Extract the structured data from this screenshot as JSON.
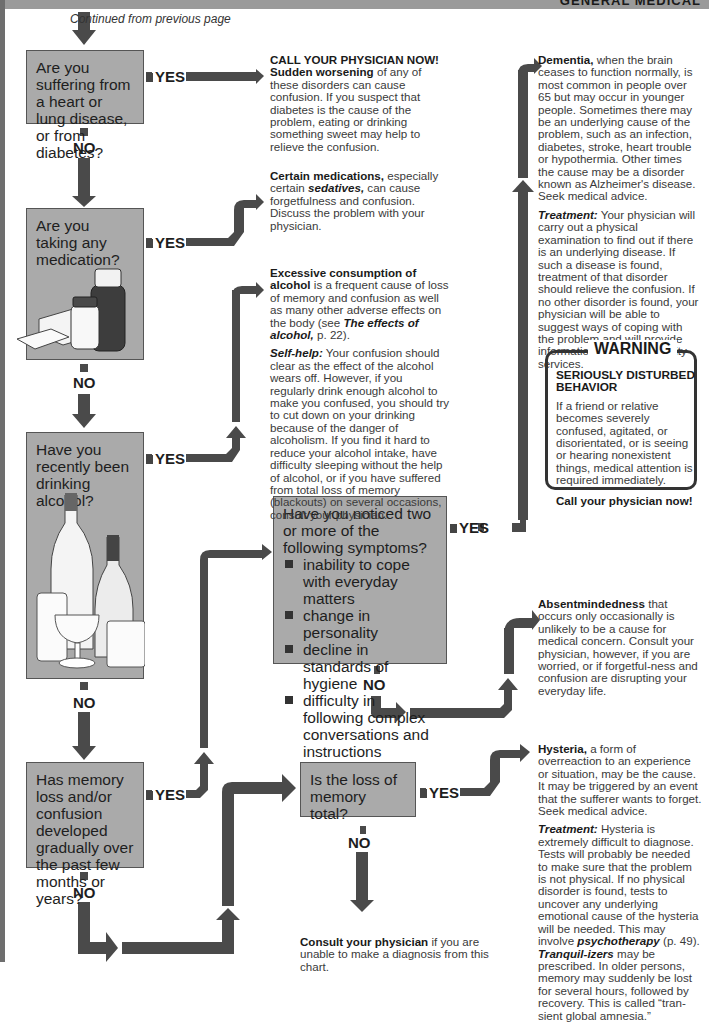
{
  "header": {
    "section_title": "GENERAL MEDICAL"
  },
  "continued_label": "Continued from  previous page",
  "labels": {
    "yes": "YES",
    "no": "NO"
  },
  "questions": [
    {
      "id": "q1",
      "text": "Are you suffering from a heart or lung disease, or from diabetes?"
    },
    {
      "id": "q2",
      "text": "Are you taking any medication?"
    },
    {
      "id": "q3",
      "text": "Have you recently been drinking alcohol?"
    },
    {
      "id": "q4",
      "text": "Has memory loss and/or confusion developed gradually over the past few months or years?"
    },
    {
      "id": "q5",
      "title": "Have you noticed two or more of the following symptoms?",
      "symptoms": [
        "inability to cope with everyday matters",
        "change in personality",
        "decline in standards of hygiene",
        "difficulty in following complex conversations and instructions"
      ]
    },
    {
      "id": "q6",
      "text": "Is the loss of memory total?"
    }
  ],
  "answers": {
    "heart_lung": {
      "heading": "CALL YOUR PHYSICIAN NOW!",
      "bold": "Sudden worsening",
      "text": " of any of these disorders can cause confusion. If you suspect that diabetes is the cause of the problem, eating or drinking something sweet may help to relieve the confusion."
    },
    "medication": {
      "bold": "Certain medications,",
      "text1": " especially certain ",
      "italic": "sedatives,",
      "text2": " can cause forgetfulness and confusion. Discuss the problem with your physician."
    },
    "alcohol": {
      "bold": "Excessive consumption of alcohol",
      "text1": " is a frequent cause of loss of memory and confusion as well as many other adverse effects on the body (see ",
      "italic": "The effects of alcohol,",
      "text2": " p. 22).",
      "selfhelp_label": "Self-help:",
      "selfhelp_text": " Your confusion should clear as the effect of the alcohol wears off. However, if you regularly drink enough alcohol to make you confused, you should try to cut down on your drinking because of the danger of alcoholism. If you find it hard to reduce your alcohol intake, have difficulty sleeping without the help of alcohol, or if you have suffered from total loss of memory (blackouts) on several occasions, consult your physician."
    },
    "dementia": {
      "bold": "Dementia,",
      "text": " when the brain ceases to function normally, is most common in people over 65 but may occur in younger people. Sometimes there may be an underlying cause of the problem, such as an infection, diabetes, stroke, heart trouble or hypothermia. Other times the cause may be a disorder known as Alzheimer's disease. Seek medical advice.",
      "treatment_label": "Treatment:",
      "treatment_text": " Your physician will carry out a physical examination to find out if there is an underlying disease. If such a disease is found, treatment of that disorder should relieve the confusion. If no other disorder is found, your physician will be able to suggest ways of coping with the problem and will provide information about community services."
    },
    "absentmindedness": {
      "bold": "Absentmindedness",
      "text": " that occurs only occasionally is unlikely to be a cause for medical concern. Consult your physician, however, if you are worried, or if forgetful-ness and confusion are disrupting your everyday life."
    },
    "hysteria": {
      "bold": "Hysteria,",
      "text": " a form of overreaction to an experience or situation, may be the cause. It may be triggered by an event that the sufferer wants to forget. Seek medical advice.",
      "treatment_label": "Treatment:",
      "treatment_text1": " Hysteria is extremely difficult to diagnose. Tests will probably be needed to make sure that the problem is not physical. If no physical disorder is found, tests to uncover any underlying emotional cause of the hysteria will be needed. This may involve ",
      "italic1": "psychotherapy",
      "treatment_text2": " (p. 49). ",
      "italic2": "Tranquil-izers",
      "treatment_text3": " may be prescribed. In older persons, memory may suddenly be lost for several hours, followed by recovery. This is called “tran-sient global amnesia.”"
    },
    "consult": {
      "bold": "Consult your physician",
      "text": " if you are unable to make a diagnosis from this chart."
    }
  },
  "warning": {
    "title": "WARNING",
    "heading": "SERIOUSLY DISTURBED BEHAVIOR",
    "text": "If a friend or relative becomes severely confused, agitated, or disorientated, or is seeing or hearing nonexistent things, medical attention is required immediately.",
    "call": "Call your physician now!"
  },
  "colors": {
    "box_fill": "#aaaaaa",
    "arrow": "#4a4a4a",
    "text": "#2b2b2b"
  }
}
